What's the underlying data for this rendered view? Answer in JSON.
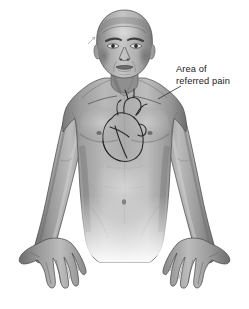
{
  "figure": {
    "name": "referred-pain-anatomy-illustration",
    "background_color": "#ffffff"
  },
  "annotations": [
    {
      "id": "referred-pain",
      "line1": "Area of",
      "line2": "referred pain",
      "target": "left shoulder",
      "text_color": "#1b1b1b",
      "leader_line_color": "#3a3a3a"
    }
  ],
  "body_parts": {
    "head": "head",
    "face": "face",
    "neck": "neck",
    "left_shoulder": "left-shoulder",
    "right_shoulder": "right-shoulder",
    "chest": "chest",
    "abdomen": "abdomen",
    "left_arm": "left-arm",
    "right_arm": "right-arm",
    "left_hand": "left-hand",
    "right_hand": "right-hand",
    "heart": "heart"
  },
  "palette": {
    "skin_light": "#d2d2d2",
    "skin_mid": "#9d9d9d",
    "skin_dark": "#6e6e6e",
    "skin_deep": "#4d4d4d",
    "outline": "#2e2e2e",
    "heart_outline": "#242424"
  }
}
